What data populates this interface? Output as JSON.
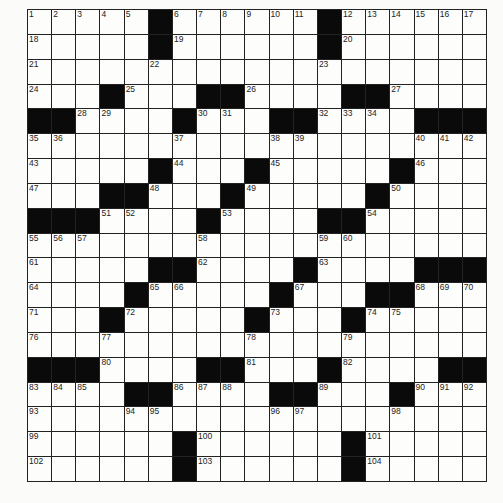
{
  "puzzle": {
    "rows": 19,
    "cols": 19,
    "black_squares": {
      "0": [
        5,
        12
      ],
      "1": [
        5,
        12
      ],
      "2": [],
      "3": [
        3,
        7,
        8,
        13,
        14
      ],
      "4": [
        0,
        1,
        6,
        10,
        11,
        16,
        17,
        18
      ],
      "5": [],
      "6": [
        5,
        9,
        15
      ],
      "7": [
        3,
        4,
        8,
        14
      ],
      "8": [
        0,
        1,
        2,
        7,
        12,
        13
      ],
      "9": [],
      "10": [
        5,
        6,
        11,
        16,
        17,
        18
      ],
      "11": [
        4,
        10,
        14,
        15
      ],
      "12": [
        3,
        9,
        13
      ],
      "13": [],
      "14": [
        0,
        1,
        2,
        7,
        8,
        12,
        17,
        18
      ],
      "15": [
        4,
        5,
        10,
        11,
        15
      ],
      "16": [],
      "17": [
        6,
        13
      ],
      "18": [
        6,
        13
      ]
    },
    "numbers": {
      "0": {
        "0": "1",
        "1": "2",
        "2": "3",
        "3": "4",
        "4": "5",
        "6": "6",
        "7": "7",
        "8": "8",
        "9": "9",
        "10": "10",
        "11": "11",
        "13": "12",
        "14": "13",
        "15": "14",
        "16": "15",
        "17": "16",
        "18": "17"
      },
      "1": {
        "0": "18",
        "6": "19",
        "13": "20"
      },
      "2": {
        "0": "21",
        "5": "22",
        "12": "23"
      },
      "3": {
        "0": "24",
        "4": "25",
        "9": "26",
        "15": "27"
      },
      "4": {
        "2": "28",
        "3": "29",
        "7": "30",
        "8": "31",
        "12": "32",
        "13": "33",
        "14": "34"
      },
      "5": {
        "0": "35",
        "1": "36",
        "6": "37",
        "10": "38",
        "11": "39",
        "16": "40",
        "17": "41",
        "18": "42"
      },
      "6": {
        "0": "43",
        "6": "44",
        "10": "45",
        "16": "46"
      },
      "7": {
        "0": "47",
        "5": "48",
        "9": "49",
        "15": "50"
      },
      "8": {
        "3": "51",
        "4": "52",
        "8": "53",
        "14": "54"
      },
      "9": {
        "0": "55",
        "1": "56",
        "2": "57",
        "7": "58",
        "12": "59",
        "13": "60"
      },
      "10": {
        "0": "61",
        "7": "62",
        "12": "63"
      },
      "11": {
        "0": "64",
        "5": "65",
        "6": "66",
        "11": "67",
        "16": "68",
        "17": "69",
        "18": "70"
      },
      "12": {
        "0": "71",
        "4": "72",
        "10": "73",
        "14": "74",
        "15": "75"
      },
      "13": {
        "0": "76",
        "3": "77",
        "9": "78",
        "13": "79"
      },
      "14": {
        "3": "80",
        "9": "81",
        "13": "82"
      },
      "15": {
        "0": "83",
        "1": "84",
        "2": "85",
        "6": "86",
        "7": "87",
        "8": "88",
        "12": "89",
        "16": "90",
        "17": "91",
        "18": "92"
      },
      "16": {
        "0": "93",
        "4": "94",
        "5": "95",
        "10": "96",
        "11": "97",
        "15": "98"
      },
      "17": {
        "0": "99",
        "7": "100",
        "14": "101"
      },
      "18": {
        "0": "102",
        "7": "103",
        "14": "104"
      }
    },
    "colors": {
      "black_square": "#0a0a0a",
      "white_square": "#fdfdfc",
      "grid_line": "#222222",
      "background": "#fbfbfa"
    }
  }
}
